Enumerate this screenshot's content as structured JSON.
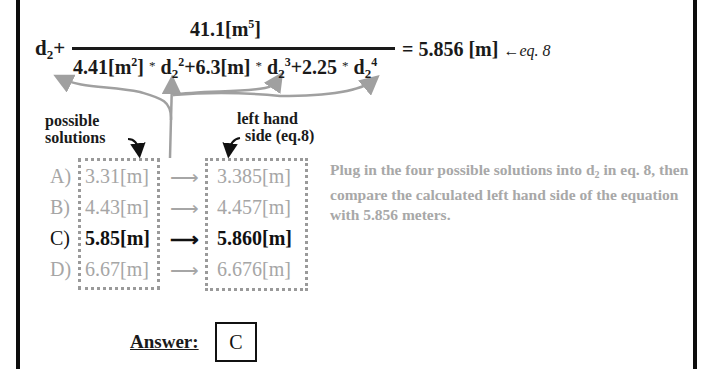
{
  "equation": {
    "lhs_var": "d",
    "lhs_sub": "2",
    "plus": "+",
    "numerator": {
      "value": "41.1[m",
      "exp": "5",
      "close": "]"
    },
    "denominator": {
      "t1_coef": "4.41[m",
      "t1_unit_exp": "2",
      "t1_close": "]",
      "star": "*",
      "var": "d",
      "sub": "2",
      "t1_exp": "2",
      "t2_coef": "+6.3[m]",
      "t2_exp": "3",
      "t3_coef": "+2.25",
      "t3_exp": "4"
    },
    "rhs": "= 5.856 [m]",
    "arrow": "←",
    "ref": "eq. 8"
  },
  "labels": {
    "possible_line1": "possible",
    "possible_line2": "solutions",
    "lhs_line1": "left hand",
    "lhs_line2": "side (eq.8)"
  },
  "rows": [
    {
      "letter": "A)",
      "solution": "3.31[m]",
      "arrow": "⟶",
      "lhs": "3.385[m]",
      "highlight": false
    },
    {
      "letter": "B)",
      "solution": "4.43[m]",
      "arrow": "⟶",
      "lhs": "4.457[m]",
      "highlight": false
    },
    {
      "letter": "C)",
      "solution": "5.85[m]",
      "arrow": "⟶",
      "lhs": "5.860[m]",
      "highlight": true
    },
    {
      "letter": "D)",
      "solution": "6.67[m]",
      "arrow": "⟶",
      "lhs": "6.676[m]",
      "highlight": false
    }
  ],
  "description": {
    "part1": "Plug in the four possible solutions into d",
    "sub": "2",
    "part2": " in eq. 8, then compare the calculated left hand side of the equation with 5.856 meters."
  },
  "answer": {
    "label": "Answer:",
    "value": "C"
  },
  "colors": {
    "dark": "#111111",
    "gray_text": "#a6a6a6",
    "arrow_gray": "#a0a0a0",
    "frame": "#0d0d0d"
  }
}
